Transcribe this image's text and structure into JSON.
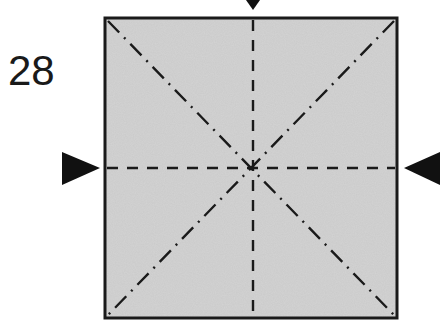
{
  "step": {
    "number": "28"
  },
  "diagram": {
    "type": "origami-fold-step",
    "paper_color": "#c8c8c8",
    "border_color": "#1a1a1a",
    "folds": [
      {
        "name": "vertical-center",
        "style": "valley",
        "line": "dashed"
      },
      {
        "name": "horizontal-center",
        "style": "valley",
        "line": "dashed"
      },
      {
        "name": "diagonal-tl-br",
        "style": "mountain",
        "line": "dash-dot"
      },
      {
        "name": "diagonal-tr-bl",
        "style": "mountain",
        "line": "dash-dot"
      }
    ],
    "arrows": [
      {
        "name": "top-push-arrow",
        "direction": "down"
      },
      {
        "name": "left-push-arrow",
        "direction": "right"
      },
      {
        "name": "right-push-arrow",
        "direction": "left"
      }
    ]
  }
}
